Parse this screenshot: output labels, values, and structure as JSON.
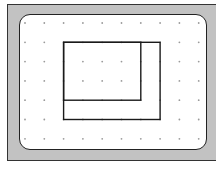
{
  "diagram": {
    "type": "geoboard",
    "colors": {
      "frame": "#c2c2c2",
      "frame_border": "#333333",
      "board": "#ffffff",
      "board_border": "#222222",
      "dot": "#9a9a9a",
      "shape_stroke": "#1a1a1a"
    },
    "grid": {
      "columns": 10,
      "rows": 7,
      "origin_x": 25,
      "origin_y": 23,
      "spacing_x": 19.3,
      "spacing_y": 19.3
    },
    "shapes": [
      {
        "name": "larger-rectangle",
        "grid_from": [
          2,
          1
        ],
        "grid_to": [
          7,
          5
        ],
        "width_units": 5,
        "height_units": 4
      },
      {
        "name": "smaller-rectangle",
        "grid_from": [
          2,
          1
        ],
        "grid_to": [
          6,
          4
        ],
        "width_units": 4,
        "height_units": 3
      }
    ]
  }
}
